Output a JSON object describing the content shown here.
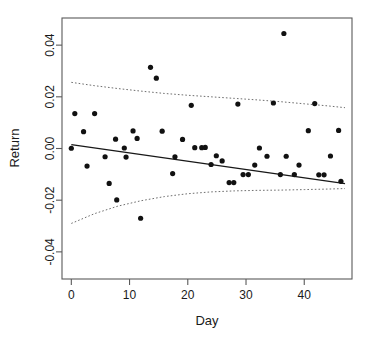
{
  "chart_data": {
    "type": "scatter",
    "title": "",
    "xlabel": "Day",
    "ylabel": "Return",
    "xlim": [
      -1.6,
      48.2
    ],
    "ylim": [
      -0.0505,
      0.0505
    ],
    "xticks": [
      0,
      10,
      20,
      30,
      40
    ],
    "xtick_labels": [
      "0",
      "10",
      "20",
      "30",
      "40"
    ],
    "yticks": [
      0.04,
      0.02,
      0.0,
      -0.02,
      -0.04
    ],
    "ytick_labels": [
      "0.04",
      "0.02",
      "0.00",
      "-0.02",
      "-0.04"
    ],
    "grid": false,
    "legend": null,
    "point_marker": "filled-circle",
    "points": [
      {
        "x": 0.0,
        "y": 0.0001
      },
      {
        "x": 0.6,
        "y": 0.0135
      },
      {
        "x": 2.1,
        "y": 0.0065
      },
      {
        "x": 2.7,
        "y": -0.0068
      },
      {
        "x": 4.0,
        "y": 0.0135
      },
      {
        "x": 5.8,
        "y": -0.0032
      },
      {
        "x": 6.5,
        "y": -0.0135
      },
      {
        "x": 7.6,
        "y": 0.0036
      },
      {
        "x": 7.8,
        "y": -0.0199
      },
      {
        "x": 9.1,
        "y": 0.0002
      },
      {
        "x": 9.4,
        "y": -0.0033
      },
      {
        "x": 10.6,
        "y": 0.0068
      },
      {
        "x": 11.3,
        "y": 0.0039
      },
      {
        "x": 11.9,
        "y": -0.027
      },
      {
        "x": 13.6,
        "y": 0.0314
      },
      {
        "x": 14.6,
        "y": 0.0272
      },
      {
        "x": 15.6,
        "y": 0.0067
      },
      {
        "x": 17.4,
        "y": -0.0097
      },
      {
        "x": 17.8,
        "y": -0.0032
      },
      {
        "x": 19.1,
        "y": 0.0035
      },
      {
        "x": 20.6,
        "y": 0.0167
      },
      {
        "x": 21.2,
        "y": 0.0003
      },
      {
        "x": 22.4,
        "y": 0.0003
      },
      {
        "x": 23.0,
        "y": 0.0004
      },
      {
        "x": 24.0,
        "y": -0.0062
      },
      {
        "x": 24.9,
        "y": -0.0028
      },
      {
        "x": 25.9,
        "y": -0.0048
      },
      {
        "x": 27.1,
        "y": -0.0132
      },
      {
        "x": 27.9,
        "y": -0.0132
      },
      {
        "x": 28.6,
        "y": 0.0172
      },
      {
        "x": 29.5,
        "y": -0.0101
      },
      {
        "x": 30.4,
        "y": -0.0101
      },
      {
        "x": 31.5,
        "y": -0.0064
      },
      {
        "x": 32.3,
        "y": 0.0002
      },
      {
        "x": 33.6,
        "y": -0.003
      },
      {
        "x": 34.7,
        "y": 0.0176
      },
      {
        "x": 35.9,
        "y": -0.0101
      },
      {
        "x": 36.5,
        "y": 0.0445
      },
      {
        "x": 36.9,
        "y": -0.003
      },
      {
        "x": 38.3,
        "y": -0.0101
      },
      {
        "x": 39.1,
        "y": -0.0064
      },
      {
        "x": 40.7,
        "y": 0.0069
      },
      {
        "x": 41.8,
        "y": 0.0174
      },
      {
        "x": 42.5,
        "y": -0.0102
      },
      {
        "x": 43.4,
        "y": -0.0102
      },
      {
        "x": 44.5,
        "y": -0.0029
      },
      {
        "x": 45.9,
        "y": 0.007
      },
      {
        "x": 46.3,
        "y": -0.0127
      }
    ],
    "fit_line": {
      "name": "least-squares fit",
      "style": "solid",
      "x": [
        0.0,
        47.0
      ],
      "y": [
        0.0015,
        -0.0136
      ]
    },
    "confidence_band_upper": {
      "name": "upper confidence limit",
      "style": "dotted",
      "x": [
        0.0,
        4.0,
        8.0,
        12.0,
        16.0,
        20.0,
        24.0,
        28.0,
        32.0,
        36.0,
        40.0,
        44.0,
        47.0
      ],
      "y": [
        0.0256,
        0.0243,
        0.0232,
        0.0222,
        0.0213,
        0.0206,
        0.02,
        0.0194,
        0.0188,
        0.0181,
        0.0173,
        0.0165,
        0.0158
      ]
    },
    "confidence_band_lower": {
      "name": "lower confidence limit",
      "style": "dotted",
      "x": [
        0.0,
        4.0,
        8.0,
        12.0,
        16.0,
        20.0,
        24.0,
        28.0,
        32.0,
        36.0,
        40.0,
        44.0,
        47.0
      ],
      "y": [
        -0.029,
        -0.0252,
        -0.0223,
        -0.0202,
        -0.0186,
        -0.0175,
        -0.0168,
        -0.0164,
        -0.0162,
        -0.0161,
        -0.0159,
        -0.0157,
        -0.0155
      ]
    }
  },
  "colors": {
    "background": "#ffffff",
    "point": "#111111",
    "fit_line": "#181818",
    "band_line": "#6f6f6f",
    "axis": "#5a5a5a",
    "text": "#1a1a1a"
  }
}
